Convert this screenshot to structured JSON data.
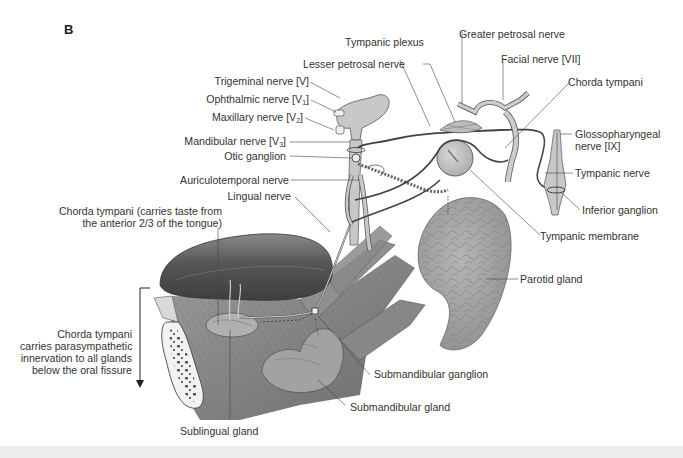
{
  "figure": {
    "panel_letter": "B",
    "colors": {
      "background": "#ffffff",
      "nerve_fill": "#c8c8c8",
      "nerve_stroke": "#555555",
      "leader_line": "#444444",
      "label_text": "#333333",
      "tongue": "#5a5a5a",
      "gland": "#9a9a9a",
      "footer_bar": "#eeeeee"
    }
  },
  "labels": {
    "tympanic_plexus": "Tympanic plexus",
    "greater_petrosal_nerve": "Greater petrosal nerve",
    "lesser_petrosal_nerve": "Lesser petrosal nerve",
    "facial_nerve": "Facial nerve [VII]",
    "trigeminal_nerve": "Trigeminal nerve [V]",
    "ophthalmic_nerve": {
      "text": "Ophthalmic nerve [V",
      "sub": "1",
      "close": "]"
    },
    "maxillary_nerve": {
      "text": "Maxillary nerve [V",
      "sub": "2",
      "close": "]"
    },
    "mandibular_nerve": {
      "text": "Mandibular nerve [V",
      "sub": "3",
      "close": "]"
    },
    "chorda_tympani_upper": "Chorda tympani",
    "glossopharyngeal_nerve_line1": "Glossopharyngeal",
    "glossopharyngeal_nerve_line2": "nerve [IX]",
    "otic_ganglion": "Otic ganglion",
    "tympanic_nerve": "Tympanic nerve",
    "auriculotemporal_nerve": "Auriculotemporal nerve",
    "inferior_ganglion": "Inferior ganglion",
    "lingual_nerve": "Lingual nerve",
    "chorda_tympani_taste_line1": "Chorda tympani (carries taste from",
    "chorda_tympani_taste_line2": "the anterior 2/3 of the tongue)",
    "tympanic_membrane": "Tympanic membrane",
    "parotid_gland": "Parotid gland",
    "chorda_parasympathetic_line1": "Chorda tympani",
    "chorda_parasympathetic_line2": "carries parasympathetic",
    "chorda_parasympathetic_line3": "innervation to all glands",
    "chorda_parasympathetic_line4": "below the oral fissure",
    "submandibular_ganglion": "Submandibular ganglion",
    "submandibular_gland": "Submandibular gland",
    "sublingual_gland": "Sublingual gland"
  }
}
